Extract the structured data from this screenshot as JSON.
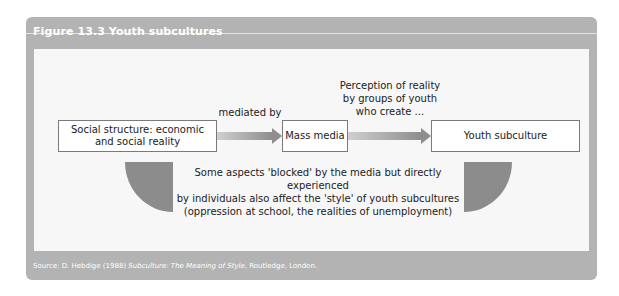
{
  "figure": {
    "title": "Figure 13.3  Youth subcultures",
    "nodes": [
      {
        "id": "social-structure",
        "label_line1": "Social structure: economic",
        "label_line2": "and social reality"
      },
      {
        "id": "mass-media",
        "label": "Mass media"
      },
      {
        "id": "youth-subculture",
        "label": "Youth subculture"
      }
    ],
    "edges": [
      {
        "from": "social-structure",
        "to": "mass-media",
        "label": "mediated by"
      },
      {
        "from": "mass-media",
        "to": "youth-subculture",
        "label_lines": [
          "Perception of reality",
          "by groups of youth",
          "who create ..."
        ]
      }
    ],
    "note_lines": [
      "Some aspects 'blocked' by the media but directly experienced",
      "by individuals also affect the 'style' of youth subcultures",
      "(oppression at school, the realities of unemployment)"
    ],
    "source": {
      "prefix": "Source: D. Hebdige (1988) ",
      "title": "Subculture: The Meaning of Style",
      "suffix": ", Routledge, London."
    }
  },
  "colors": {
    "panel": "#b3b3b3",
    "inner": "#f7f7f7",
    "quarter": "#8c8c8c",
    "arrow": "#8e8e8e"
  }
}
